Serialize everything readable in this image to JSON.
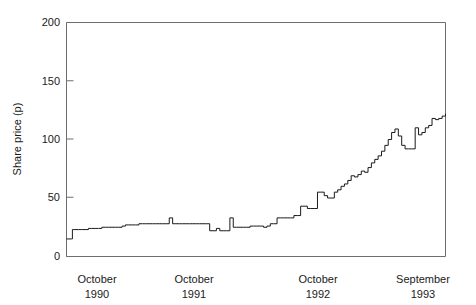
{
  "chart_data": {
    "type": "line",
    "title": "",
    "subtitle": "",
    "xlabel": "",
    "ylabel": "Share price (p)",
    "ylim": [
      0,
      200
    ],
    "xlim": [
      0,
      36
    ],
    "grid": false,
    "legend": false,
    "legend_position": "none",
    "y_ticks": [
      0,
      50,
      100,
      150,
      200
    ],
    "y_tick_labels": [
      "0",
      "50",
      "100",
      "150",
      "200"
    ],
    "x_tick_labels": [
      {
        "month": "October",
        "year": "1990",
        "x": 0
      },
      {
        "month": "October",
        "year": "1991",
        "x": 12
      },
      {
        "month": "October",
        "year": "1992",
        "x": 24
      },
      {
        "month": "September",
        "year": "1993",
        "x": 35
      }
    ],
    "series": [
      {
        "name": "Share price",
        "x": [
          0.0,
          0.3,
          0.6,
          0.7,
          1.0,
          1.4,
          1.8,
          2.2,
          2.6,
          3.0,
          3.4,
          3.8,
          4.2,
          4.6,
          5.0,
          5.4,
          5.8,
          6.2,
          6.6,
          7.0,
          7.4,
          7.8,
          8.2,
          8.6,
          9.0,
          9.4,
          9.8,
          10.2,
          10.6,
          11.0,
          11.4,
          11.8,
          12.2,
          12.6,
          13.0,
          13.4,
          13.8,
          14.2,
          14.6,
          15.0,
          15.4,
          15.8,
          16.2,
          16.6,
          17.0,
          17.4,
          17.8,
          18.2,
          18.6,
          19.0,
          19.4,
          19.8,
          20.2,
          20.6,
          21.0,
          21.4,
          21.8,
          22.2,
          22.6,
          23.0,
          23.4,
          23.8,
          24.2,
          24.6,
          25.0,
          25.4,
          25.8,
          26.2,
          26.6,
          27.0,
          27.4,
          27.8,
          28.2,
          28.6,
          29.0,
          29.4,
          29.8,
          30.2,
          30.6,
          31.0,
          31.4,
          31.8,
          32.2,
          32.6,
          33.0,
          33.4,
          33.8,
          34.2,
          34.6,
          35.0,
          35.4,
          35.8
        ],
        "values": [
          15,
          15,
          15,
          23,
          23,
          23,
          23,
          23,
          24,
          24,
          24,
          24,
          25,
          25,
          25,
          25,
          25,
          25,
          26,
          27,
          27,
          27,
          27,
          28,
          28,
          28,
          28,
          28,
          28,
          28,
          28,
          28,
          33,
          28,
          28,
          28,
          28,
          28,
          28,
          28,
          28,
          28,
          28,
          28,
          22,
          22,
          24,
          22,
          22,
          22,
          33,
          25,
          25,
          25,
          25,
          25,
          26,
          26,
          26,
          26,
          25,
          26,
          28,
          28,
          33,
          33,
          33,
          33,
          33,
          35,
          35,
          43,
          43,
          41,
          41,
          41,
          55,
          55,
          52,
          50,
          50,
          55,
          57,
          60,
          62,
          65,
          69,
          68,
          70,
          73,
          72,
          76
        ],
        "color": "#1a1a1a"
      },
      {
        "name": "Share price (continued)",
        "x": [
          35.8,
          36.2,
          36.6,
          37.0,
          37.4,
          37.8,
          38.2,
          38.6,
          39.0,
          39.4,
          39.8,
          40.2,
          40.6,
          41.0,
          41.4,
          41.8,
          42.2,
          42.6,
          43.0,
          43.4,
          43.8,
          44.2,
          44.6,
          45.0
        ],
        "values": [
          76,
          80,
          83,
          86,
          90,
          95,
          100,
          106,
          109,
          103,
          95,
          92,
          92,
          92,
          110,
          104,
          106,
          110,
          112,
          118,
          117,
          118,
          120,
          122
        ],
        "color": "#1a1a1a"
      }
    ],
    "annotations": [],
    "notable_points": {
      "start_value": 15,
      "end_value": 153,
      "max_value": 153,
      "min_value": 15,
      "first_plateau": 23,
      "mid_plateau": 28,
      "spike_1991": 33,
      "step_1992": 55,
      "peak_before_dip": 109
    }
  },
  "axes": {
    "y_title": "Share price (p)",
    "y_tick_0": "0",
    "y_tick_50": "50",
    "y_tick_100": "100",
    "y_tick_150": "150",
    "y_tick_200": "200",
    "x_label_1_month": "October",
    "x_label_1_year": "1990",
    "x_label_2_month": "October",
    "x_label_2_year": "1991",
    "x_label_3_month": "October",
    "x_label_3_year": "1992",
    "x_label_4_month": "September",
    "x_label_4_year": "1993"
  },
  "colors": {
    "line": "#1a1a1a",
    "axis": "#6e6e6e",
    "text": "#1a1a1a",
    "background": "#ffffff"
  }
}
